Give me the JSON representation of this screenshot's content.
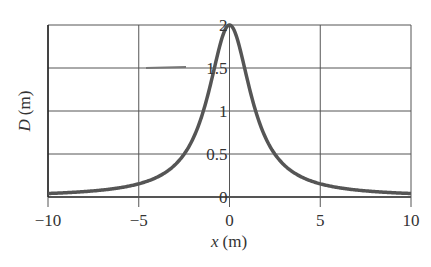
{
  "chart_data": {
    "type": "line",
    "title": "",
    "xlabel": "x (m)",
    "xlabel_var": "x",
    "xlabel_unit": "(m)",
    "ylabel": "D (m)",
    "ylabel_var": "D",
    "ylabel_unit": "(m)",
    "xlim": [
      -10,
      10
    ],
    "ylim": [
      0,
      2
    ],
    "x_ticks": [
      -10,
      -5,
      0,
      5,
      10
    ],
    "x_tick_labels": [
      "−10",
      "−5",
      "0",
      "5",
      "10"
    ],
    "y_ticks": [
      0,
      0.5,
      1,
      1.5,
      2
    ],
    "y_tick_labels": [
      "0",
      "0.5",
      "1",
      "1.5",
      "2"
    ],
    "grid": true,
    "legend": null,
    "series": [
      {
        "name": "D(x)",
        "x": [
          -10,
          -9,
          -8,
          -7,
          -6,
          -5,
          -4,
          -3,
          -2.5,
          -2,
          -1.5,
          -1,
          -0.5,
          0,
          0.5,
          1,
          1.5,
          2,
          2.5,
          3,
          4,
          5,
          6,
          7,
          8,
          9,
          10
        ],
        "values": [
          0.04,
          0.05,
          0.06,
          0.08,
          0.11,
          0.15,
          0.23,
          0.37,
          0.5,
          0.68,
          0.96,
          1.35,
          1.79,
          2.0,
          1.79,
          1.35,
          0.96,
          0.68,
          0.5,
          0.37,
          0.23,
          0.15,
          0.11,
          0.08,
          0.06,
          0.05,
          0.04
        ]
      }
    ],
    "colors": {
      "curve": "#555555",
      "grid": "#555555",
      "axis": "#222222",
      "text": "#333333"
    }
  }
}
